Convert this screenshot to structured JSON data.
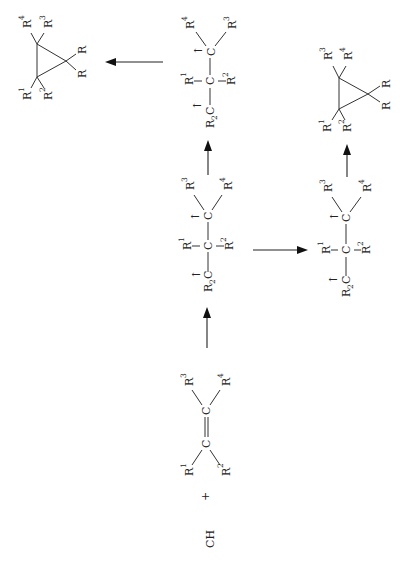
{
  "diagram": {
    "orientation": "rotated 90 degrees counter-clockwise",
    "reagent": {
      "label": "CH",
      "subscript": "2",
      "dot_marks": ":"
    },
    "plus": "+",
    "alkene": {
      "atoms": [
        "C",
        "C"
      ],
      "bond": "=",
      "substituents": {
        "r1": "R",
        "r1_sup": "1",
        "r2": "R",
        "r2_sup": "2",
        "r3": "R",
        "r3_sup": "3",
        "r4": "R",
        "r4_sup": "4"
      }
    },
    "intermediate_a": {
      "label": "R2C-C(R1)(R2)-C(R3)(R4) diradical",
      "r2c": "R",
      "r2c_sub": "2",
      "c": "C",
      "r1": "R",
      "r1_sup": "1",
      "r2": "R",
      "r2_sup": "2",
      "r3": "R",
      "r3_sup": "3",
      "r4": "R",
      "r4_sup": "4",
      "spin_marks": [
        "↑",
        "↑"
      ]
    },
    "intermediate_b": {
      "label": "rotated conformer",
      "r2c": "R",
      "r2c_sub": "2",
      "c": "C",
      "r1": "R",
      "r1_sup": "1",
      "r2": "R",
      "r2_sup": "2",
      "r3": "R",
      "r3_sup": "3",
      "r4": "R",
      "r4_sup": "4",
      "spin_marks": [
        "↑",
        "↑"
      ]
    },
    "intermediate_c": {
      "label": "spin-flipped conformer",
      "r2c": "R",
      "r2c_sub": "2",
      "c": "C",
      "r1": "R",
      "r1_sup": "1",
      "r2": "R",
      "r2_sup": "2",
      "r3": "R",
      "r3_sup": "3",
      "r4": "R",
      "r4_sup": "4",
      "spin_marks": [
        "↑",
        "↑"
      ]
    },
    "product_a": {
      "ring": "cyclopropane",
      "r": "R",
      "r1": "R",
      "r1_sup": "1",
      "r2": "R",
      "r2_sup": "2",
      "r3": "R",
      "r3_sup": "3",
      "r4": "R",
      "r4_sup": "4"
    },
    "product_b": {
      "ring": "cyclopropane",
      "r": "R",
      "r1": "R",
      "r1_sup": "1",
      "r2": "R",
      "r2_sup": "2",
      "r3": "R",
      "r3_sup": "3",
      "r4": "R",
      "r4_sup": "4"
    },
    "arrows": [
      {
        "from": "alkene",
        "to": "intermediate_a",
        "direction": "up"
      },
      {
        "from": "intermediate_a",
        "to": "intermediate_b",
        "direction": "right"
      },
      {
        "from": "intermediate_a",
        "to": "intermediate_c",
        "direction": "up"
      },
      {
        "from": "intermediate_b",
        "to": "product_b",
        "direction": "up"
      },
      {
        "from": "intermediate_c",
        "to": "product_a",
        "direction": "left"
      }
    ],
    "colors": {
      "ink": "#222222",
      "background": "#ffffff"
    }
  }
}
